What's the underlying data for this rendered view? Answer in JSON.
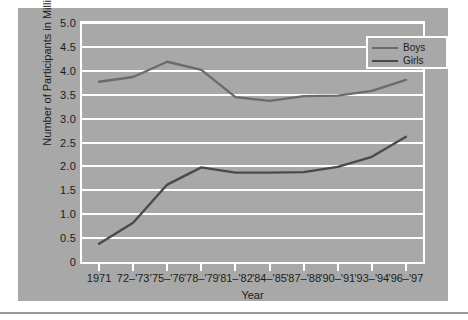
{
  "chart_data": {
    "type": "line",
    "title": "",
    "xlabel": "Year",
    "ylabel": "Number of Participants in Millions",
    "ylim": [
      0,
      5.0
    ],
    "yticks": [
      "0",
      "0.5",
      "1.0",
      "1.5",
      "2.0",
      "2.5",
      "3.0",
      "3.5",
      "4.0",
      "4.5",
      "5.0"
    ],
    "ytick_values": [
      0,
      0.5,
      1.0,
      1.5,
      2.0,
      2.5,
      3.0,
      3.5,
      4.0,
      4.5,
      5.0
    ],
    "grid": true,
    "legend_position": "top-right",
    "categories": [
      "1971",
      "72–'73",
      "'75–'76",
      "'78–'79",
      "'81–'82",
      "'84–'85",
      "'87–'88",
      "'90–'91",
      "'93–'94",
      "'96–'97"
    ],
    "series": [
      {
        "name": "Boys",
        "color": "#6b6b6b",
        "values": [
          3.77,
          3.87,
          4.19,
          4.02,
          3.45,
          3.37,
          3.47,
          3.48,
          3.58,
          3.81
        ]
      },
      {
        "name": "Girls",
        "color": "#4a4a4a",
        "values": [
          0.38,
          0.82,
          1.62,
          1.98,
          1.87,
          1.87,
          1.88,
          1.99,
          2.2,
          2.62
        ]
      }
    ]
  },
  "legend": {
    "items": [
      {
        "label": "Boys"
      },
      {
        "label": "Girls"
      }
    ]
  },
  "colors": {
    "figure_background": "#a8a8a8",
    "grid": "#ffffff",
    "text": "#1c1c1c",
    "boys_line": "#6b6b6b",
    "girls_line": "#4a4a4a",
    "page_background": "#ffffff",
    "divider": "#9a9a9a"
  }
}
